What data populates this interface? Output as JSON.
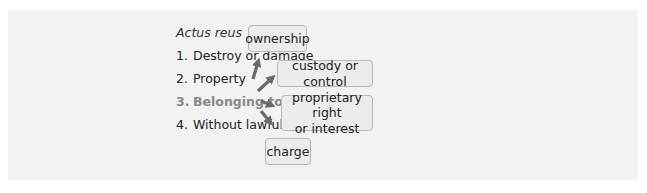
{
  "diagram": {
    "heading": "Actus reus",
    "items": [
      {
        "num": "1.",
        "label": "Destroy or damage"
      },
      {
        "num": "2.",
        "label": "Property"
      },
      {
        "num": "3.",
        "label": "Belonging to another",
        "highlighted": true
      },
      {
        "num": "4.",
        "label": "Without lawful excuse"
      }
    ],
    "boxes": [
      {
        "label": "ownership"
      },
      {
        "label": "custody or control"
      },
      {
        "label": "proprietary right or interest",
        "line1": "proprietary right",
        "line2": "or interest"
      },
      {
        "label": "charge"
      }
    ],
    "colors": {
      "panel_bg": "#f2f2f2",
      "box_bg": "#ececec",
      "box_border": "#b8b8b8",
      "arrow": "#6b6b6b",
      "highlight_text": "#888888"
    }
  }
}
